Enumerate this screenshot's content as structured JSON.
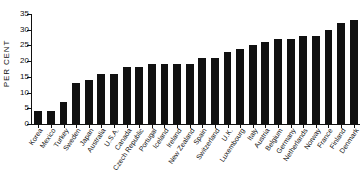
{
  "chart_data": {
    "type": "bar",
    "title": "",
    "xlabel": "",
    "ylabel": "PER CENT",
    "ylim": [
      0,
      35
    ],
    "yticks": [
      0,
      5,
      10,
      15,
      20,
      25,
      30,
      35
    ],
    "grid": false,
    "legend": false,
    "bar_color": "#111111",
    "categories": [
      "Korea",
      "Mexico",
      "Turkey",
      "Sweden",
      "Japan",
      "Australia",
      "U.S.A.",
      "Canada",
      "Czech Republic",
      "Portugal",
      "Iceland",
      "Ireland",
      "New Zealand",
      "Spain",
      "Switzerland",
      "U.K.",
      "Luxembourg",
      "Italy",
      "Austria",
      "Belgium",
      "Germany",
      "Netherlands",
      "Norway",
      "France",
      "Finland",
      "Denmark"
    ],
    "values": [
      4,
      4,
      7,
      13,
      14,
      16,
      16,
      18,
      18,
      19,
      19,
      19,
      19,
      21,
      21,
      23,
      24,
      25,
      26,
      27,
      27,
      28,
      28,
      30,
      32,
      33
    ]
  }
}
